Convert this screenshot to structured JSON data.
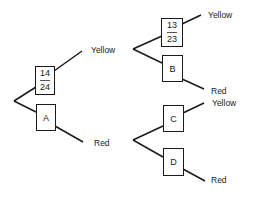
{
  "diagram": {
    "type": "probability tree",
    "trees": [
      {
        "id": "left-tree",
        "branches": [
          {
            "box": {
              "numerator": "14",
              "denominator": "24"
            },
            "outcome": "Yellow"
          },
          {
            "box": {
              "label": "A"
            },
            "outcome": "Red"
          }
        ]
      },
      {
        "id": "upper-right-tree",
        "branches": [
          {
            "box": {
              "numerator": "13",
              "denominator": "23"
            },
            "outcome": "Yellow"
          },
          {
            "box": {
              "label": "B"
            },
            "outcome": "Red"
          }
        ]
      },
      {
        "id": "lower-right-tree",
        "branches": [
          {
            "box": {
              "label": "C"
            },
            "outcome": "Yellow"
          },
          {
            "box": {
              "label": "D"
            },
            "outcome": "Red"
          }
        ]
      }
    ]
  }
}
